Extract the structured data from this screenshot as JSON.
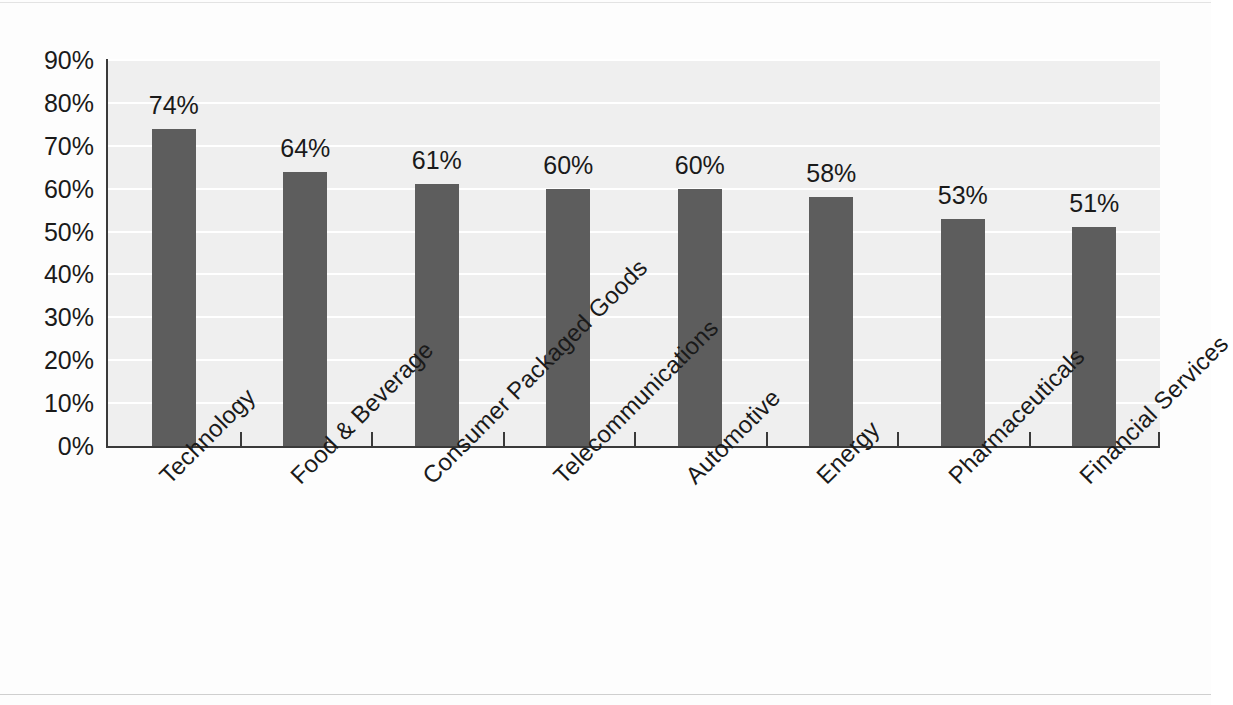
{
  "chart_data": {
    "type": "bar",
    "title": "",
    "subtitle": "",
    "xlabel": "",
    "ylabel": "",
    "ylim": [
      0,
      90
    ],
    "y_tick_step": 10,
    "y_tick_labels": [
      "90%",
      "80%",
      "70%",
      "60%",
      "50%",
      "40%",
      "30%",
      "20%",
      "10%",
      "0%"
    ],
    "y_tick_values": [
      90,
      80,
      70,
      60,
      50,
      40,
      30,
      20,
      10,
      0
    ],
    "grid": true,
    "grid_orientation": "horizontal",
    "legend": false,
    "legend_position": "none",
    "value_format": "percent",
    "categories": [
      "Technology",
      "Food & Beverage",
      "Consumer Packaged Goods",
      "Telecommunications",
      "Automotive",
      "Energy",
      "Pharmaceuticals",
      "Financial Services"
    ],
    "values": [
      74,
      64,
      61,
      60,
      60,
      58,
      53,
      51
    ],
    "data_labels": [
      "74%",
      "64%",
      "61%",
      "60%",
      "60%",
      "58%",
      "53%",
      "51%"
    ],
    "colors": {
      "bar": "#5d5d5d",
      "plot_background": "#efefef",
      "page_background": "#fdfdfd",
      "gridline": "#ffffff",
      "axis": "#3a3a3a",
      "text": "#1a1a1a"
    }
  }
}
